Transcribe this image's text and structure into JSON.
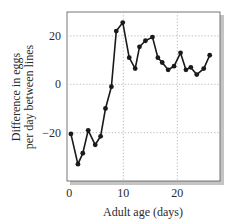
{
  "chart_data": {
    "type": "line",
    "title": "",
    "xlabel": "Adult age (days)",
    "ylabel_lines": [
      "Difference in eggs",
      "per day between lines"
    ],
    "ylabel": "Difference in eggs per day between lines",
    "xlim": [
      0,
      28
    ],
    "ylim": [
      -38,
      30
    ],
    "xticks": [
      0,
      10,
      20
    ],
    "yticks": [
      20,
      0,
      -20
    ],
    "xtick_labels": [
      "0",
      "10",
      "20"
    ],
    "ytick_labels": [
      "20",
      "0",
      "−20"
    ],
    "grid": true,
    "legend": null,
    "series": [
      {
        "name": "Difference",
        "color": "#1a1a1a",
        "marker": "circle",
        "x": [
          0.3,
          1.6,
          2.5,
          3.5,
          4.8,
          5.8,
          6.7,
          7.8,
          8.7,
          9.9,
          11.1,
          12.2,
          13.0,
          14.1,
          15.4,
          16.4,
          17.2,
          18.3,
          19.4,
          20.6,
          21.6,
          22.5,
          23.6,
          24.9,
          26.0
        ],
        "y": [
          -20.5,
          -33,
          -28.5,
          -19,
          -25,
          -21.5,
          -10,
          -1,
          22,
          25.5,
          11,
          6.5,
          15.5,
          18,
          19.5,
          11,
          9,
          6,
          7.5,
          13,
          6,
          7,
          4,
          6.5,
          12
        ]
      }
    ]
  },
  "colors": {
    "line": "#1a1a1a",
    "grid": "#b8b8b8",
    "frame": "#555555",
    "shadow": "#bdbdbd"
  }
}
